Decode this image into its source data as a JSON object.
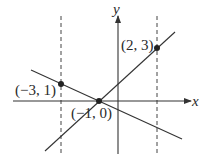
{
  "diagram": {
    "axes": {
      "x_label": "x",
      "y_label": "y"
    },
    "points": [
      {
        "label": "(2, 3)",
        "x": 2,
        "y": 3
      },
      {
        "label": "(−3, 1)",
        "x": -3,
        "y": 1
      },
      {
        "label": "(−1, 0)",
        "x": -1,
        "y": 0
      }
    ],
    "lines": [
      {
        "name": "line-through-(-1,0)-and-(2,3)",
        "slope": 1,
        "intercept": 1
      },
      {
        "name": "line-through-(-3,1)-and-(-1,0)",
        "slope": -0.5,
        "intercept": -0.5
      }
    ],
    "dashed_verticals": [
      {
        "x": -3
      },
      {
        "x": 2
      }
    ],
    "colors": {
      "stroke": "#333333",
      "point": "#222222"
    }
  }
}
